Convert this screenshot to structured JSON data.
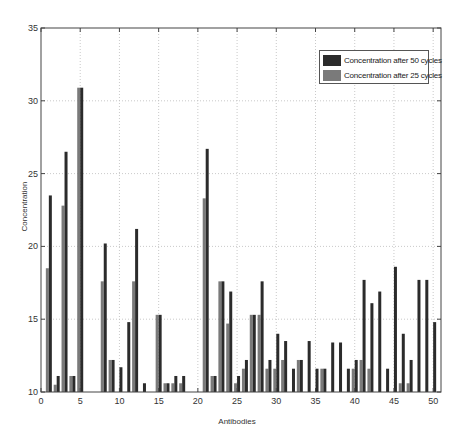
{
  "chart_data": {
    "type": "bar",
    "title": "",
    "xlabel": "Antibodies",
    "ylabel": "Concentration",
    "xlim": [
      0,
      51
    ],
    "ylim": [
      10,
      35
    ],
    "xticks": [
      0,
      5,
      10,
      15,
      20,
      25,
      30,
      35,
      40,
      45,
      50
    ],
    "yticks": [
      10,
      15,
      20,
      25,
      30,
      35
    ],
    "grid": true,
    "legend_position": "upper right",
    "categories": [
      1,
      2,
      3,
      4,
      5,
      6,
      7,
      8,
      9,
      10,
      11,
      12,
      13,
      14,
      15,
      16,
      17,
      18,
      19,
      20,
      21,
      22,
      23,
      24,
      25,
      26,
      27,
      28,
      29,
      30,
      31,
      32,
      33,
      34,
      35,
      36,
      37,
      38,
      39,
      40,
      41,
      42,
      43,
      44,
      45,
      46,
      47,
      48,
      49,
      50
    ],
    "series": [
      {
        "name": "Concentration after 25 cycles",
        "color": "#7a7a7a",
        "values": [
          18.5,
          10.5,
          22.8,
          11.1,
          30.9,
          10,
          10,
          17.6,
          12.2,
          10,
          10,
          17.6,
          10,
          10,
          15.3,
          10.6,
          10.6,
          10.6,
          10,
          10,
          23.3,
          11.1,
          17.6,
          14.7,
          10.6,
          11.6,
          15.3,
          15.3,
          11.6,
          11.6,
          12.2,
          10,
          12.2,
          10,
          10,
          11.6,
          10,
          10,
          10,
          11.6,
          12.2,
          11.6,
          10,
          10,
          10,
          10.6,
          10.6,
          10,
          10,
          10
        ]
      },
      {
        "name": "Concentration after 50 cycles",
        "color": "#2b2b2b",
        "values": [
          23.5,
          11.1,
          26.5,
          11.1,
          30.9,
          10,
          10,
          20.2,
          12.2,
          11.7,
          14.8,
          21.2,
          10.6,
          10,
          15.3,
          10.6,
          11.1,
          11.1,
          10,
          10,
          26.7,
          11.1,
          17.6,
          16.9,
          11.1,
          12.2,
          15.3,
          17.6,
          12.2,
          14.0,
          13.5,
          11.6,
          12.2,
          13.5,
          11.6,
          11.6,
          13.4,
          13.4,
          11.6,
          12.2,
          17.7,
          16.1,
          16.9,
          11.6,
          18.6,
          14.0,
          12.2,
          17.7,
          17.7,
          14.8
        ]
      }
    ]
  },
  "legend": {
    "items": [
      {
        "label": "Concentration after 50 cycles",
        "color": "#2b2b2b"
      },
      {
        "label": "Concentration after 25 cycles",
        "color": "#7a7a7a"
      }
    ]
  },
  "axes": {
    "xlabel": "Antibodies",
    "ylabel": "Concentration"
  }
}
